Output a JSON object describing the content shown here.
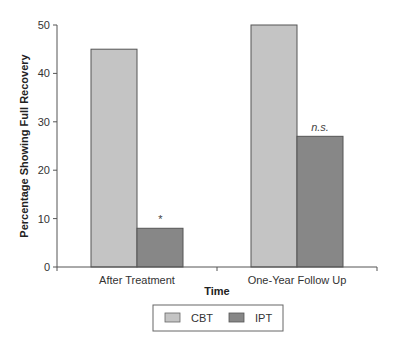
{
  "chart_data": {
    "type": "bar",
    "title": "",
    "xlabel": "Time",
    "ylabel": "Percentage Showing Full Recovery",
    "ylim": [
      0,
      50
    ],
    "yticks": [
      0,
      10,
      20,
      30,
      40,
      50
    ],
    "categories": [
      "After Treatment",
      "One-Year Follow Up"
    ],
    "series": [
      {
        "name": "CBT",
        "color": "#c4c4c4",
        "values": [
          45,
          50
        ]
      },
      {
        "name": "IPT",
        "color": "#878787",
        "values": [
          8,
          27
        ]
      }
    ],
    "annotations": [
      {
        "category": "After Treatment",
        "series": "IPT",
        "text": "*"
      },
      {
        "category": "One-Year Follow Up",
        "series": "IPT",
        "text": "n.s."
      }
    ],
    "grid": false,
    "legend_position": "bottom-center"
  }
}
